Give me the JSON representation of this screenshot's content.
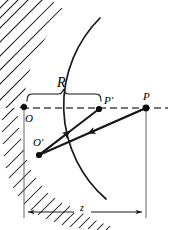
{
  "figure": {
    "type": "optics-ray-diagram",
    "colors": {
      "ink": "#1a1a1a",
      "background": "#ffffff",
      "axis": "#555555"
    },
    "labels": {
      "radius": "R",
      "distance": "z",
      "vertex": "O",
      "vertex_prime": "O'",
      "point_p_prime": "P'",
      "point_p": "P"
    },
    "geometry": {
      "mirror_center_x": 148,
      "mirror_center_y": 108,
      "mirror_radius": 124,
      "axis_y": 108,
      "point_O": [
        24,
        107
      ],
      "point_O_prime": [
        39,
        155
      ],
      "point_P_prime": [
        99,
        109
      ],
      "point_P": [
        146,
        108
      ],
      "dimension_y": 212,
      "brace_y": 98,
      "brace_left_x": 27,
      "brace_right_x": 100
    },
    "hatching": {
      "upper_style": "long-diagonal",
      "lower_style": "short-dense",
      "side": "outside-convex"
    }
  }
}
